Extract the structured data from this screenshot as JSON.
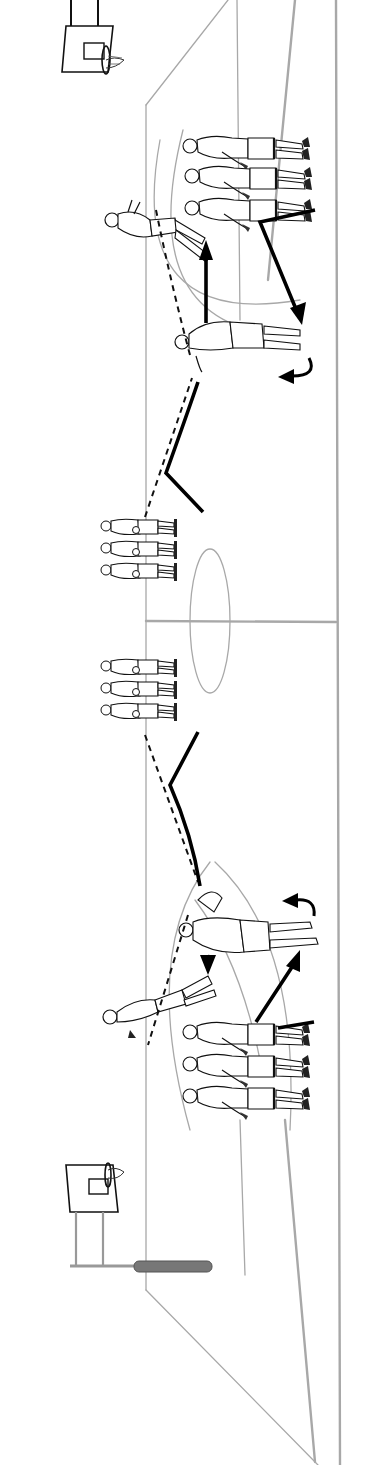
{
  "figure": {
    "title": "",
    "colors": {
      "court_lines": "#a8a8a8",
      "ink": "#111111",
      "background": "#ffffff",
      "padding": "#777777"
    },
    "elements": {
      "baskets": [
        {
          "name": "top-basket",
          "end": "top"
        },
        {
          "name": "bottom-basket",
          "end": "bottom",
          "has_padded_base": true
        }
      ],
      "player_groups": [
        {
          "name": "top-baseline-line",
          "count": 3,
          "facing": "left"
        },
        {
          "name": "top-center-line",
          "count": 3,
          "facing": "left"
        },
        {
          "name": "bottom-center-line",
          "count": 3,
          "facing": "left"
        },
        {
          "name": "bottom-baseline-line",
          "count": 3,
          "facing": "left"
        }
      ],
      "active_players": [
        {
          "name": "top-shooter",
          "action": "shooting"
        },
        {
          "name": "top-receiver",
          "action": "catching pass"
        },
        {
          "name": "bottom-shooter",
          "action": "rebounding"
        },
        {
          "name": "bottom-receiver",
          "action": "catching pass"
        }
      ],
      "passes": [
        {
          "name": "top-pass-to-receiver"
        },
        {
          "name": "top-pass-to-shooter"
        },
        {
          "name": "bottom-pass-to-receiver"
        },
        {
          "name": "bottom-pass-to-shooter"
        }
      ],
      "movements": [
        {
          "name": "top-v-cut",
          "style": "solid"
        },
        {
          "name": "top-drive-to-basket",
          "style": "solid"
        },
        {
          "name": "top-cut-from-line",
          "style": "solid"
        },
        {
          "name": "top-pivot-turn",
          "style": "curved"
        },
        {
          "name": "bottom-v-cut",
          "style": "solid"
        },
        {
          "name": "bottom-drive-to-basket",
          "style": "solid"
        },
        {
          "name": "bottom-cut-from-line",
          "style": "solid"
        },
        {
          "name": "bottom-pivot-turn",
          "style": "curved"
        }
      ]
    }
  }
}
